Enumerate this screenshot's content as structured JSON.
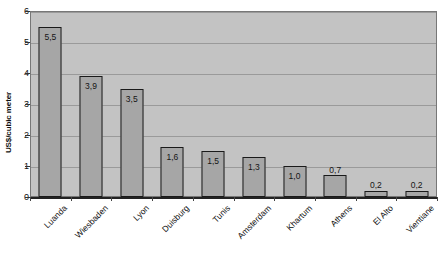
{
  "chart_data": {
    "type": "bar",
    "title": "",
    "xlabel": "",
    "ylabel": "US$/cubic meter",
    "categories": [
      "Luanda",
      "Wiesbaden",
      "Lyon",
      "Duisburg",
      "Tunis",
      "Amsterdam",
      "Khartum",
      "Athens",
      "El Alto",
      "Vientiane"
    ],
    "values": [
      5.5,
      3.9,
      3.5,
      1.6,
      1.5,
      1.3,
      1.0,
      0.7,
      0.2,
      0.2
    ],
    "value_labels": [
      "5,5",
      "3,9",
      "3,5",
      "1,6",
      "1,5",
      "1,3",
      "1,0",
      "0,7",
      "0,2",
      "0,2"
    ],
    "ylim": [
      0,
      6
    ],
    "yticks": [
      0,
      1,
      2,
      3,
      4,
      5,
      6
    ],
    "ytick_labels": [
      "0",
      "1",
      "2",
      "3",
      "4",
      "5",
      "6"
    ],
    "grid": true,
    "legend": false,
    "legend_position": "none",
    "colors": {
      "bar_fill": "#a6a6a6",
      "bar_border": "#1a1a1a",
      "plot_background": "#c3c3c3",
      "gridline": "#9a9a9a",
      "axis": "#222222",
      "text": "#111111"
    }
  }
}
